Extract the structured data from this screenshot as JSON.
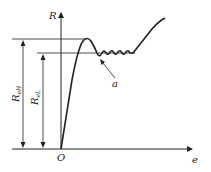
{
  "diagram": {
    "type": "stress-strain curve with yield plateau",
    "axes": {
      "y_label": "R",
      "x_label": "e",
      "origin_label": "O"
    },
    "annotations": {
      "upper_yield": {
        "label": "R",
        "subscript": "eH"
      },
      "lower_yield": {
        "label": "R",
        "subscript": "eL"
      },
      "point_a": "a"
    },
    "colors": {
      "line": "#222222",
      "background": "#ffffff"
    }
  }
}
